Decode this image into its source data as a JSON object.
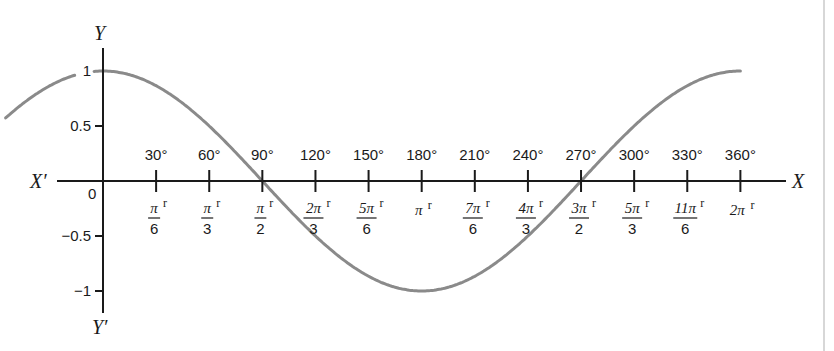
{
  "chart_data": {
    "type": "line",
    "title": "",
    "function": "y = cos x",
    "xlabel": "X",
    "xlabel_negative": "X′",
    "ylabel": "Y",
    "ylabel_negative": "Y′",
    "origin_label": "0",
    "y_ticks": [
      {
        "value": 1,
        "label": "1"
      },
      {
        "value": 0.5,
        "label": "0.5"
      },
      {
        "value": -0.5,
        "label": "−0.5"
      },
      {
        "value": -1,
        "label": "−1"
      }
    ],
    "ylim": [
      -1,
      1
    ],
    "xlim_degrees": [
      -55,
      360
    ],
    "x_ticks": [
      {
        "deg": 30,
        "deg_label": "30°",
        "num": "π",
        "den": "6",
        "whole": ""
      },
      {
        "deg": 60,
        "deg_label": "60°",
        "num": "π",
        "den": "3",
        "whole": ""
      },
      {
        "deg": 90,
        "deg_label": "90°",
        "num": "π",
        "den": "2",
        "whole": ""
      },
      {
        "deg": 120,
        "deg_label": "120°",
        "num": "2π",
        "den": "3",
        "whole": ""
      },
      {
        "deg": 150,
        "deg_label": "150°",
        "num": "5π",
        "den": "6",
        "whole": ""
      },
      {
        "deg": 180,
        "deg_label": "180°",
        "num": "",
        "den": "",
        "whole": "π"
      },
      {
        "deg": 210,
        "deg_label": "210°",
        "num": "7π",
        "den": "6",
        "whole": ""
      },
      {
        "deg": 240,
        "deg_label": "240°",
        "num": "4π",
        "den": "3",
        "whole": ""
      },
      {
        "deg": 270,
        "deg_label": "270°",
        "num": "3π",
        "den": "2",
        "whole": ""
      },
      {
        "deg": 300,
        "deg_label": "300°",
        "num": "5π",
        "den": "3",
        "whole": ""
      },
      {
        "deg": 330,
        "deg_label": "330°",
        "num": "11π",
        "den": "6",
        "whole": ""
      },
      {
        "deg": 360,
        "deg_label": "360°",
        "num": "",
        "den": "",
        "whole": "2π"
      }
    ],
    "radian_suffix": "r",
    "series": [
      {
        "name": "cos x",
        "color": "#8a8a8a",
        "x_deg": [
          -55,
          -30,
          0,
          30,
          60,
          90,
          120,
          150,
          180,
          210,
          240,
          270,
          300,
          330,
          360
        ],
        "y": [
          0.57,
          0.87,
          1,
          0.87,
          0.5,
          0,
          -0.5,
          -0.87,
          -1,
          -0.87,
          -0.5,
          0,
          0.5,
          0.87,
          1
        ]
      }
    ],
    "grid": false,
    "legend": "none"
  },
  "layout": {
    "origin_x": 103,
    "origin_y": 181,
    "px_per_degree": 1.7705,
    "px_per_unit": 110,
    "x_axis_start": 57,
    "x_axis_end": 786,
    "y_axis_top": 48,
    "y_axis_bottom": 313,
    "curve_gap_label_1": [
      76,
      94
    ],
    "right_edge_line_x": 824
  },
  "colors": {
    "axis": "#1a1a1a",
    "curve": "#8a8a8a",
    "background": "#ffffff"
  }
}
